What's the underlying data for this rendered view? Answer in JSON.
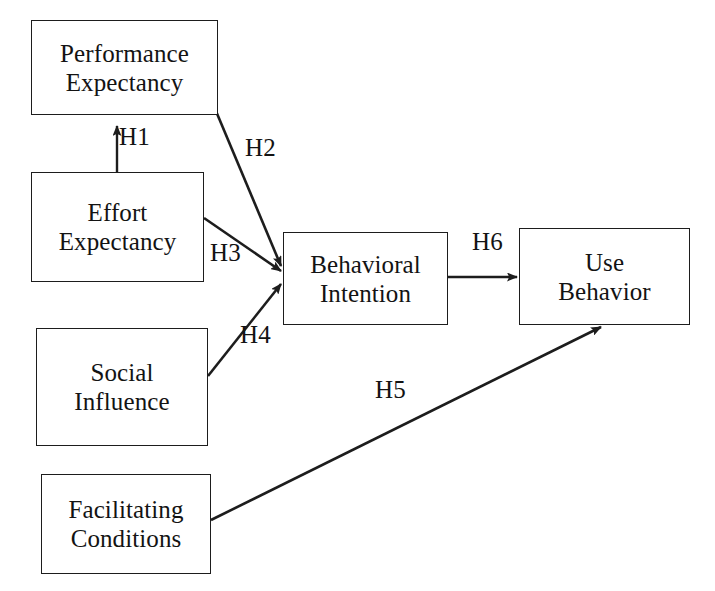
{
  "diagram": {
    "type": "path-diagram",
    "background_color": "#ffffff",
    "line_color": "#1d1d1d",
    "text_color": "#131313",
    "nodes": [
      {
        "id": "performance-expectancy",
        "line1": "Performance",
        "line2": "Expectancy",
        "x": 31,
        "y": 20,
        "w": 187,
        "h": 95
      },
      {
        "id": "effort-expectancy",
        "line1": "Effort",
        "line2": "Expectancy",
        "x": 31,
        "y": 172,
        "w": 173,
        "h": 110
      },
      {
        "id": "social-influence",
        "line1": "Social",
        "line2": "Influence",
        "x": 36,
        "y": 328,
        "w": 172,
        "h": 118
      },
      {
        "id": "facilitating-conditions",
        "line1": "Facilitating",
        "line2": "Conditions",
        "x": 41,
        "y": 474,
        "w": 170,
        "h": 100
      },
      {
        "id": "behavioral-intention",
        "line1": "Behavioral",
        "line2": "Intention",
        "x": 283,
        "y": 232,
        "w": 165,
        "h": 93
      },
      {
        "id": "use-behavior",
        "line1": "Use",
        "line2": "Behavior",
        "x": 519,
        "y": 228,
        "w": 171,
        "h": 97
      }
    ],
    "edges": [
      {
        "id": "h1",
        "label": "H1",
        "from": "effort-expectancy",
        "to": "performance-expectancy",
        "label_x": 119,
        "label_y": 124
      },
      {
        "id": "h2",
        "label": "H2",
        "from": "performance-expectancy",
        "to": "behavioral-intention",
        "label_x": 245,
        "label_y": 135
      },
      {
        "id": "h3",
        "label": "H3",
        "from": "effort-expectancy",
        "to": "behavioral-intention",
        "label_x": 210,
        "label_y": 240
      },
      {
        "id": "h4",
        "label": "H4",
        "from": "social-influence",
        "to": "behavioral-intention",
        "label_x": 240,
        "label_y": 322
      },
      {
        "id": "h5",
        "label": "H5",
        "from": "facilitating-conditions",
        "to": "use-behavior",
        "label_x": 375,
        "label_y": 377
      },
      {
        "id": "h6",
        "label": "H6",
        "from": "behavioral-intention",
        "to": "use-behavior",
        "label_x": 472,
        "label_y": 229
      }
    ]
  }
}
